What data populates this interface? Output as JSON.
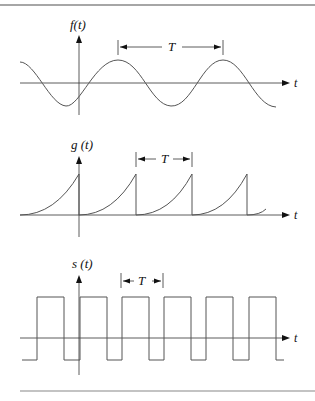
{
  "figure": {
    "panels": [
      {
        "name": "sinusoid",
        "y_label": "f(t)",
        "x_label": "t",
        "period_label": "T"
      },
      {
        "name": "sawtooth",
        "y_label": "g (t)",
        "x_label": "t",
        "period_label": "T"
      },
      {
        "name": "square-wave",
        "y_label": "s (t)",
        "x_label": "t",
        "period_label": "T"
      }
    ]
  }
}
